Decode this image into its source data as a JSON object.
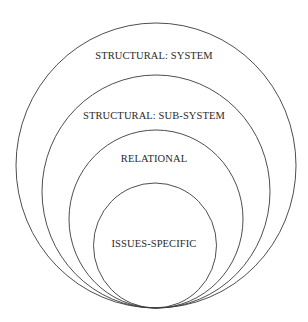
{
  "diagram": {
    "type": "nested-circles",
    "stroke_color": "#3a3a3a",
    "background": "#ffffff",
    "layers": [
      {
        "label": "STRUCTURAL: SYSTEM",
        "cx": 156,
        "cy": 166,
        "rx": 140,
        "ry": 142
      },
      {
        "label": "STRUCTURAL: SUB-SYSTEM",
        "cx": 156,
        "cy": 191.5,
        "rx": 114,
        "ry": 116.5
      },
      {
        "label": "RELATIONAL",
        "cx": 156,
        "cy": 219,
        "rx": 87,
        "ry": 89
      },
      {
        "label": "ISSUES-SPECIFIC",
        "cx": 155,
        "cy": 245.5,
        "rx": 61.5,
        "ry": 62.5
      }
    ]
  }
}
